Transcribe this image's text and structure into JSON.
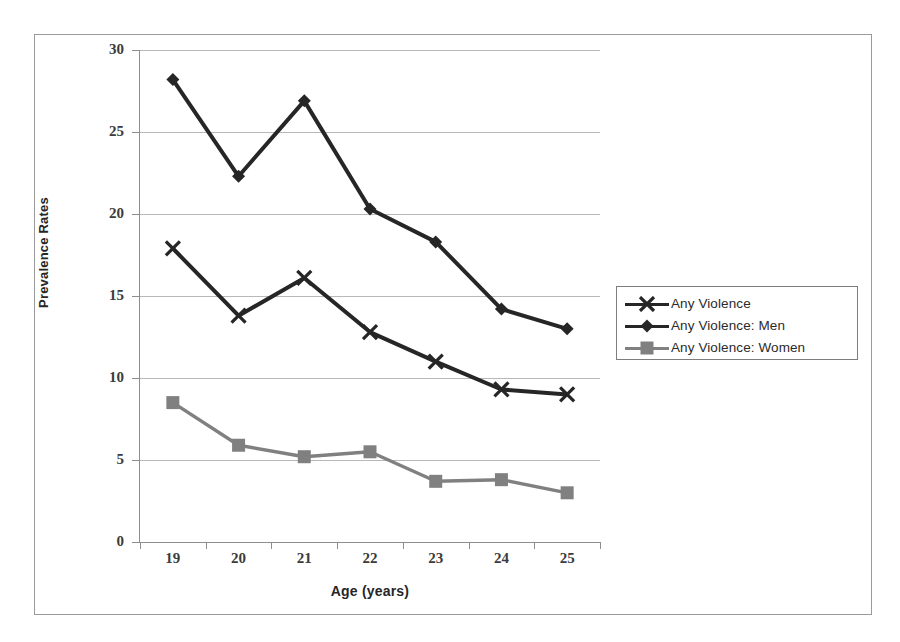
{
  "chart_data": {
    "type": "line",
    "title": "",
    "xlabel": "Age (years)",
    "ylabel": "Prevalence Rates",
    "categories": [
      "19",
      "20",
      "21",
      "22",
      "23",
      "24",
      "25"
    ],
    "x": [
      19,
      20,
      21,
      22,
      23,
      24,
      25
    ],
    "xlim": [
      18.5,
      25.5
    ],
    "ylim": [
      0,
      30
    ],
    "y_ticks": [
      "0",
      "5",
      "10",
      "15",
      "20",
      "25",
      "30"
    ],
    "y_tick_values": [
      0,
      5,
      10,
      15,
      20,
      25,
      30
    ],
    "grid": "horizontal",
    "legend_position": "right",
    "series": [
      {
        "name": "Any Violence",
        "marker": "x-cross",
        "color": "#262626",
        "values": [
          17.9,
          13.8,
          16.1,
          12.8,
          11.0,
          9.3,
          9.0
        ]
      },
      {
        "name": "Any Violence: Men",
        "marker": "diamond",
        "color": "#262626",
        "values": [
          28.2,
          22.3,
          26.9,
          20.3,
          18.3,
          14.2,
          13.0
        ]
      },
      {
        "name": "Any Violence: Women",
        "marker": "square",
        "color": "#808080",
        "values": [
          8.5,
          5.9,
          5.2,
          5.5,
          3.7,
          3.8,
          3.0
        ]
      }
    ]
  },
  "axes": {
    "x_title": "Age (years)",
    "y_title": "Prevalence Rates",
    "x_tick_labels": [
      "19",
      "20",
      "21",
      "22",
      "23",
      "24",
      "25"
    ],
    "y_tick_labels": [
      "30",
      "25",
      "20",
      "15",
      "10",
      "5",
      "0"
    ]
  },
  "legend": {
    "items": [
      {
        "label": "Any Violence",
        "marker": "x-cross",
        "color": "#262626"
      },
      {
        "label": "Any Violence: Men",
        "marker": "diamond",
        "color": "#262626"
      },
      {
        "label": "Any Violence: Women",
        "marker": "square",
        "color": "#808080"
      }
    ]
  },
  "colors": {
    "series_dark": "#262626",
    "series_gray": "#808080",
    "gridline": "#b8b8b8",
    "axis": "#8d8d8d",
    "frame": "#9a9a9a",
    "background": "#ffffff"
  }
}
